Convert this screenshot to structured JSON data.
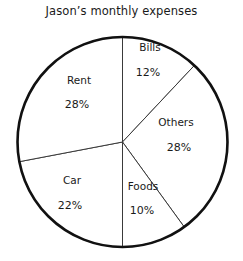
{
  "chart_data": {
    "type": "pie",
    "title": "Jason’s monthly expenses",
    "xlabel": "",
    "ylabel": "",
    "legend": "none",
    "grid": false,
    "start_angle_deg": 0,
    "direction": "clockwise",
    "categories": [
      "Bills",
      "Others",
      "Foods",
      "Car",
      "Rent"
    ],
    "values": [
      12,
      28,
      10,
      22,
      28
    ],
    "value_suffix": "%",
    "total": 100,
    "slices": [
      {
        "label": "Bills",
        "value": 12,
        "value_text": "12%",
        "label_x": 150,
        "label_y": 47,
        "value_x": 148,
        "value_y": 73
      },
      {
        "label": "Others",
        "value": 28,
        "value_text": "28%",
        "label_x": 176,
        "label_y": 122,
        "value_x": 179,
        "value_y": 148
      },
      {
        "label": "Foods",
        "value": 10,
        "value_text": "10%",
        "label_x": 143,
        "label_y": 186,
        "value_x": 142,
        "value_y": 211
      },
      {
        "label": "Car",
        "value": 22,
        "value_text": "22%",
        "label_x": 72,
        "label_y": 180,
        "value_x": 70,
        "value_y": 206
      },
      {
        "label": "Rent",
        "value": 28,
        "value_text": "28%",
        "label_x": 79,
        "label_y": 80,
        "value_x": 77,
        "value_y": 105
      }
    ],
    "geometry": {
      "center_x": 122.5,
      "center_y": 142,
      "radius": 105
    },
    "colors": {
      "slice_fill": "#ffffff",
      "outline": "#111111",
      "divider": "#3a3a3a",
      "text": "#1a1a1a",
      "background": "#ffffff"
    }
  }
}
